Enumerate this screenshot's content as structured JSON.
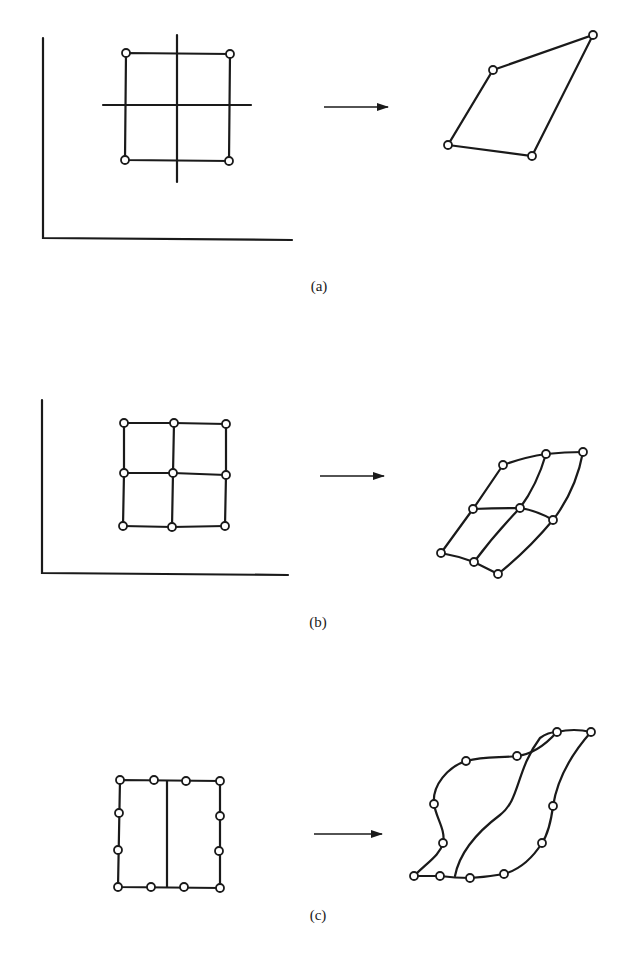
{
  "figure": {
    "panels": [
      {
        "id": "a",
        "caption": "(a)",
        "caption_pos": [
          319,
          286
        ],
        "source": {
          "axes": {
            "origin": [
              43,
              238
            ],
            "y_top": 38,
            "x_right": 292
          },
          "square_nodes": [
            [
              126,
              53
            ],
            [
              230,
              54
            ],
            [
              229,
              161
            ],
            [
              125,
              160
            ]
          ],
          "cross_lines": [
            [
              [
                177,
                35
              ],
              [
                177,
                182
              ]
            ],
            [
              [
                103,
                105
              ],
              [
                251,
                105
              ]
            ]
          ]
        },
        "arrow": {
          "from": [
            324,
            107
          ],
          "to": [
            388,
            107
          ]
        },
        "target": {
          "quad_nodes": [
            [
              493,
              70
            ],
            [
              593,
              35
            ],
            [
              532,
              156
            ],
            [
              448,
              145
            ]
          ]
        }
      },
      {
        "id": "b",
        "caption": "(b)",
        "caption_pos": [
          318,
          622
        ],
        "source": {
          "axes": {
            "origin": [
              42,
              573
            ],
            "y_top": 400,
            "x_right": 288
          },
          "grid_nodes": [
            [
              [
                124,
                423
              ],
              [
                174,
                423
              ],
              [
                226,
                424
              ]
            ],
            [
              [
                124,
                473
              ],
              [
                173,
                473
              ],
              [
                226,
                475
              ]
            ],
            [
              [
                123,
                526
              ],
              [
                172,
                527
              ],
              [
                225,
                526
              ]
            ]
          ]
        },
        "arrow": {
          "from": [
            320,
            476
          ],
          "to": [
            384,
            476
          ]
        },
        "target": {
          "grid_nodes": [
            [
              [
                503,
                465
              ],
              [
                546,
                454
              ],
              [
                583,
                452
              ]
            ],
            [
              [
                473,
                509
              ],
              [
                520,
                508
              ],
              [
                553,
                520
              ]
            ],
            [
              [
                441,
                553
              ],
              [
                474,
                562
              ],
              [
                498,
                574
              ]
            ]
          ]
        }
      },
      {
        "id": "c",
        "caption": "(c)",
        "caption_pos": [
          318,
          915
        ],
        "source": {
          "top_nodes": [
            [
              120,
              780
            ],
            [
              154,
              780
            ],
            [
              186,
              781
            ],
            [
              220,
              781
            ]
          ],
          "left_nodes": [
            [
              119,
              813
            ],
            [
              118,
              850
            ]
          ],
          "right_nodes": [
            [
              220,
              816
            ],
            [
              219,
              851
            ]
          ],
          "bottom_nodes": [
            [
              118,
              887
            ],
            [
              151,
              887
            ],
            [
              184,
              887
            ],
            [
              220,
              888
            ]
          ],
          "divider": [
            [
              167,
              781
            ],
            [
              167,
              887
            ]
          ]
        },
        "arrow": {
          "from": [
            314,
            834
          ],
          "to": [
            382,
            834
          ]
        },
        "target": {
          "top_nodes": [
            [
              414,
              876
            ],
            [
              466,
              761
            ],
            [
              517,
              756
            ],
            [
              557,
              732
            ],
            [
              591,
              732
            ]
          ],
          "side_nodes": [
            [
              434,
              804
            ],
            [
              443,
              843
            ],
            [
              553,
              806
            ],
            [
              542,
              843
            ]
          ],
          "bottom_nodes": [
            [
              440,
              876
            ],
            [
              470,
              878
            ],
            [
              504,
              874
            ]
          ]
        }
      }
    ]
  }
}
